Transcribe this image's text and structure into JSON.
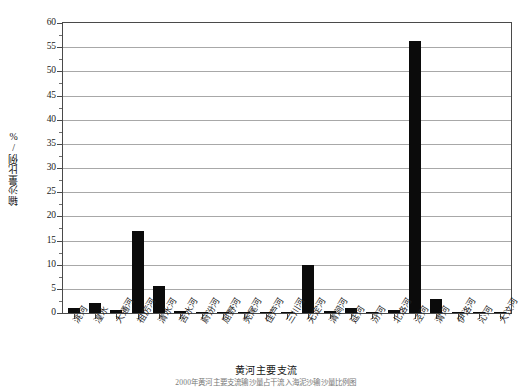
{
  "chart_data": {
    "type": "bar",
    "title": "",
    "xlabel": "黄河主要支流",
    "ylabel": "输沙量比例/%",
    "ylim": [
      0,
      60
    ],
    "ytick_step": 5,
    "yminor_step": 2.5,
    "grid": true,
    "legend": "none",
    "bar_color": "#0b0b0b",
    "categories": [
      "洮河",
      "湟水",
      "大通河",
      "祖厉河",
      "清水河",
      "苦水河",
      "蔚汾河",
      "屈野河",
      "秃尾河",
      "佳芦河",
      "三川河",
      "无定河",
      "清涧河",
      "延河",
      "汾河",
      "北洛河",
      "泾河",
      "渭河",
      "伊洛河",
      "沁河",
      "大汶河"
    ],
    "values": [
      1.1,
      2.1,
      0.6,
      17.0,
      5.5,
      0.4,
      0.05,
      0.1,
      0.12,
      0.25,
      0.2,
      10.0,
      0.4,
      1.0,
      0.1,
      0.7,
      56.3,
      2.8,
      0.08,
      0.05,
      0.03
    ],
    "ytick_labels": [
      "0",
      "5",
      "10",
      "15",
      "20",
      "25",
      "30",
      "35",
      "40",
      "45",
      "50",
      "55",
      "60"
    ],
    "caption": "2000年黄河主要支流输沙量占干流入海泥沙输沙量比例图"
  }
}
